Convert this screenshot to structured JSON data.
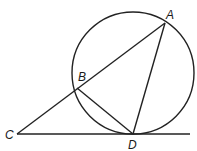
{
  "diagram": {
    "type": "circle-tangent-secant",
    "stroke_color": "#222222",
    "background": "#ffffff",
    "circle": {
      "cx": 133,
      "cy": 73,
      "r": 61
    },
    "points": {
      "A": {
        "label": "A",
        "x": 165,
        "y": 23,
        "lx": 166,
        "ly": 19
      },
      "B": {
        "label": "B",
        "x": 77,
        "y": 88,
        "lx": 78,
        "ly": 81
      },
      "C": {
        "label": "C",
        "x": 17,
        "y": 134,
        "lx": 5,
        "ly": 139
      },
      "D": {
        "label": "D",
        "x": 133,
        "y": 134,
        "lx": 128,
        "ly": 149
      }
    },
    "segments": [
      {
        "name": "secant-CA",
        "from": "C",
        "to": "A"
      },
      {
        "name": "chord-AD",
        "from": "A",
        "to": "D"
      },
      {
        "name": "chord-BD",
        "from": "B",
        "to": "D"
      }
    ],
    "tangent_line": {
      "x1": 17,
      "y1": 134,
      "x2": 190,
      "y2": 134
    }
  }
}
